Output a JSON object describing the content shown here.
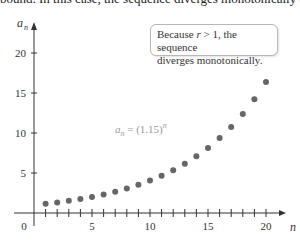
{
  "top_text": "bound. In this case, the sequence diverges monotonically (",
  "callout": {
    "line1_pre": "Because ",
    "line1_var": "r",
    "line1_post": " > 1, the sequence",
    "line2": "diverges monotonically."
  },
  "formula": {
    "lhs": "a",
    "sub": "n",
    "eq": " = (1.15)",
    "sup": "n"
  },
  "colors": {
    "point": "#666666",
    "axis": "#333333",
    "formula": "#9a9a9a"
  },
  "chart_data": {
    "type": "scatter",
    "title": "",
    "xlabel": "n",
    "ylabel": "a_n",
    "function": "a_n = (1.15)^n",
    "x": [
      1,
      2,
      3,
      4,
      5,
      6,
      7,
      8,
      9,
      10,
      11,
      12,
      13,
      14,
      15,
      16,
      17,
      18,
      19,
      20
    ],
    "values": [
      1.15,
      1.32,
      1.52,
      1.75,
      2.01,
      2.31,
      2.66,
      3.06,
      3.52,
      4.05,
      4.65,
      5.35,
      6.15,
      7.08,
      8.14,
      9.36,
      10.76,
      12.38,
      14.23,
      16.37
    ],
    "xticks": [
      0,
      5,
      10,
      15,
      20
    ],
    "yticks": [
      5,
      10,
      15,
      20
    ],
    "xlim": [
      0,
      21
    ],
    "ylim": [
      0,
      22
    ],
    "grid": false,
    "annotations": [
      "Because r > 1, the sequence diverges monotonically.",
      "a_n = (1.15)^n"
    ]
  }
}
